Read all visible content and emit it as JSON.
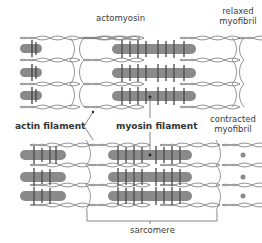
{
  "figure": {
    "labels": {
      "actomyosin": "actomyosin",
      "relaxed_line1": "relaxed",
      "relaxed_line2": "myofibril",
      "actin_filament": "actin filament",
      "myosin_filament": "myosin filament",
      "contracted_line1": "contracted",
      "contracted_line2": "myofibril",
      "sarcomere": "sarcomere"
    },
    "colors": {
      "myosin_fill": "#8a8a8a",
      "myosin_dark": "#4a4a4a",
      "actin_stroke": "#6e6e6e",
      "zline_stroke": "#7a7a7a",
      "text": "#3c3c3c"
    },
    "panels": [
      {
        "name": "relaxed",
        "rows": 3,
        "z_lines_x": [
          82,
          240
        ]
      },
      {
        "name": "contracted",
        "rows": 3,
        "z_lines_x": [
          88,
          220
        ]
      }
    ]
  }
}
